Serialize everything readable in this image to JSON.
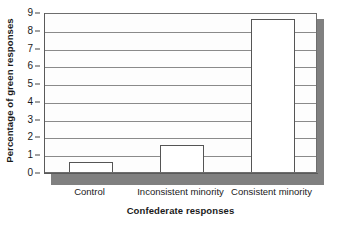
{
  "chart_data": {
    "type": "bar",
    "title": "",
    "categories": [
      "Control",
      "Inconsistent minority",
      "Consistent minority"
    ],
    "values": [
      0.55,
      1.5,
      8.6
    ],
    "xlabel": "Confederate responses",
    "ylabel": "Percentage of green responses",
    "ylim": [
      0,
      9
    ],
    "yticks": [
      0,
      1,
      2,
      3,
      4,
      5,
      6,
      7,
      8,
      9
    ],
    "ytick_labels": [
      "0",
      "1",
      "2",
      "3",
      "4",
      "5",
      "6",
      "7",
      "8",
      "9"
    ],
    "grid": true,
    "grid_axis": "y",
    "legend": false,
    "legend_position": "none",
    "bar_face_color": "#ffffff",
    "bar_edge_color": "#555555",
    "panel_background": "#fdfdfd",
    "shadow_color": "#808080",
    "text_color": "#1a1a1a"
  }
}
